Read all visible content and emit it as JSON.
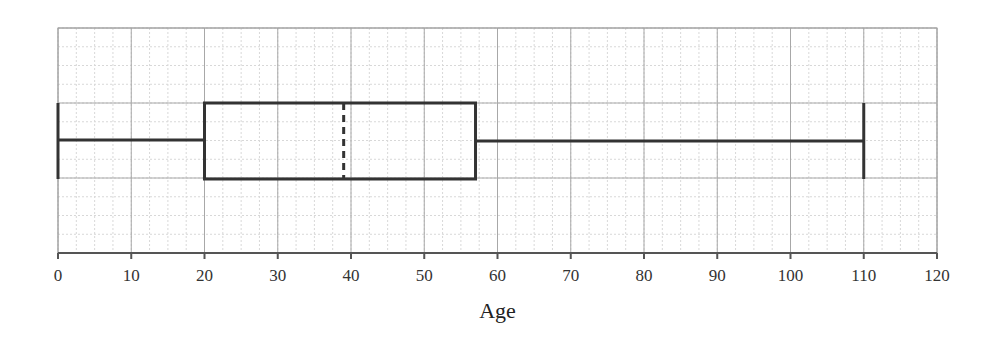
{
  "chart_data": {
    "type": "boxplot",
    "title": "",
    "xlabel": "Age",
    "ylabel": "",
    "xlim": [
      0,
      120
    ],
    "x_ticks": [
      0,
      10,
      20,
      30,
      40,
      50,
      60,
      70,
      80,
      90,
      100,
      110,
      120
    ],
    "x_tick_labels": [
      "0",
      "10",
      "20",
      "30",
      "40",
      "50",
      "60",
      "70",
      "80",
      "90",
      "100",
      "110",
      "120"
    ],
    "grid": true,
    "minor_grid_step": 2.5,
    "major_grid_step": 10,
    "box": {
      "min": 0,
      "q1": 20,
      "median": 39,
      "q3": 57,
      "max": 110
    },
    "median_style": "dashed",
    "colors": {
      "box_line": "#333333",
      "major_grid": "#a8a8a8",
      "minor_grid": "#d8d8d8",
      "axis": "#555555"
    }
  }
}
